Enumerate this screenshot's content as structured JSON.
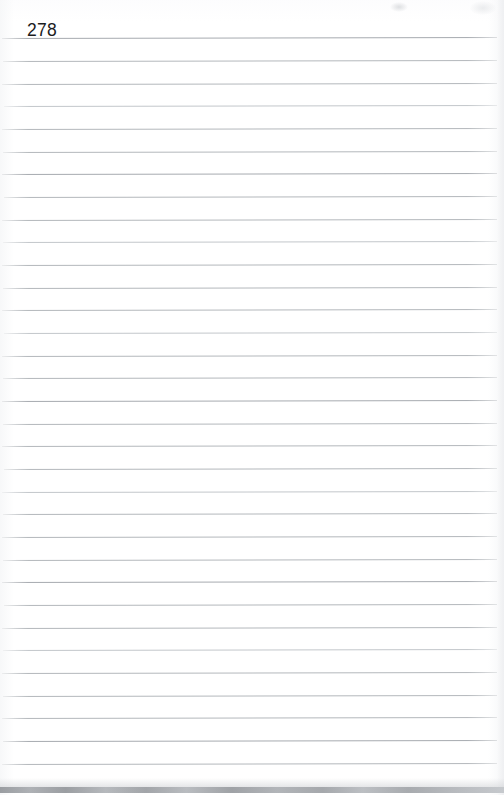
{
  "document": {
    "type": "scanned-notebook-page",
    "page_number": "278",
    "content_text": "",
    "page_width": 504,
    "page_height": 795,
    "background_color": "#ffffff",
    "page_number_color": "#1b1c1e",
    "page_number_position": {
      "x": 27,
      "y": 20
    },
    "page_number_font_size": 17.5
  },
  "ruling": {
    "line_color": "#b4b8bc",
    "line_color_light": "#c3c7cb",
    "line_color_dark": "#a7abb0",
    "line_count": 33,
    "line_thickness": 1,
    "first_line_y": 38,
    "line_spacing": 22.7,
    "line_left_x": 2,
    "line_right_x": 497,
    "skew_degrees": -0.12,
    "lines": [
      {
        "y": 38,
        "left": 2,
        "width": 495,
        "tone": "dark"
      },
      {
        "y": 61,
        "left": 3,
        "width": 494,
        "tone": "normal"
      },
      {
        "y": 84,
        "left": 2,
        "width": 495,
        "tone": "normal"
      },
      {
        "y": 106,
        "left": 4,
        "width": 493,
        "tone": "dim"
      },
      {
        "y": 129,
        "left": 2,
        "width": 495,
        "tone": "normal"
      },
      {
        "y": 152,
        "left": 3,
        "width": 494,
        "tone": "normal"
      },
      {
        "y": 174,
        "left": 2,
        "width": 495,
        "tone": "dark"
      },
      {
        "y": 197,
        "left": 4,
        "width": 493,
        "tone": "normal"
      },
      {
        "y": 220,
        "left": 2,
        "width": 495,
        "tone": "normal"
      },
      {
        "y": 242,
        "left": 3,
        "width": 494,
        "tone": "dim"
      },
      {
        "y": 265,
        "left": 2,
        "width": 495,
        "tone": "normal"
      },
      {
        "y": 288,
        "left": 3,
        "width": 494,
        "tone": "normal"
      },
      {
        "y": 310,
        "left": 2,
        "width": 495,
        "tone": "normal"
      },
      {
        "y": 333,
        "left": 4,
        "width": 493,
        "tone": "dim"
      },
      {
        "y": 356,
        "left": 2,
        "width": 495,
        "tone": "normal"
      },
      {
        "y": 378,
        "left": 3,
        "width": 494,
        "tone": "normal"
      },
      {
        "y": 401,
        "left": 2,
        "width": 495,
        "tone": "dark"
      },
      {
        "y": 424,
        "left": 3,
        "width": 494,
        "tone": "normal"
      },
      {
        "y": 446,
        "left": 2,
        "width": 495,
        "tone": "normal"
      },
      {
        "y": 469,
        "left": 4,
        "width": 493,
        "tone": "normal"
      },
      {
        "y": 492,
        "left": 2,
        "width": 495,
        "tone": "dim"
      },
      {
        "y": 514,
        "left": 3,
        "width": 494,
        "tone": "normal"
      },
      {
        "y": 537,
        "left": 2,
        "width": 495,
        "tone": "normal"
      },
      {
        "y": 560,
        "left": 3,
        "width": 494,
        "tone": "normal"
      },
      {
        "y": 582,
        "left": 2,
        "width": 495,
        "tone": "dark"
      },
      {
        "y": 605,
        "left": 4,
        "width": 493,
        "tone": "normal"
      },
      {
        "y": 628,
        "left": 2,
        "width": 495,
        "tone": "normal"
      },
      {
        "y": 650,
        "left": 3,
        "width": 494,
        "tone": "dim"
      },
      {
        "y": 673,
        "left": 2,
        "width": 495,
        "tone": "normal"
      },
      {
        "y": 696,
        "left": 3,
        "width": 494,
        "tone": "normal"
      },
      {
        "y": 718,
        "left": 2,
        "width": 495,
        "tone": "normal"
      },
      {
        "y": 741,
        "left": 3,
        "width": 494,
        "tone": "dark"
      },
      {
        "y": 764,
        "left": 2,
        "width": 495,
        "tone": "normal"
      }
    ]
  },
  "scan_artifacts": {
    "bottom_band": {
      "y": 787,
      "height": 6,
      "soft_y": 778,
      "soft_height": 9,
      "color": "#a9acb0"
    },
    "smudge": {
      "x": 390,
      "y": 2,
      "width": 18,
      "height": 10
    },
    "smudge_secondary": {
      "x": 470,
      "y": 1,
      "width": 26,
      "height": 14
    }
  }
}
